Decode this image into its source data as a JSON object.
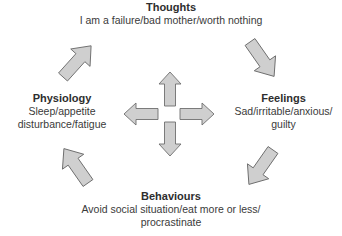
{
  "diagram": {
    "type": "cycle",
    "nodes": [
      {
        "id": "thoughts",
        "title": "Thoughts",
        "desc_lines": [
          "I am a failure/bad mother/worth nothing"
        ]
      },
      {
        "id": "feelings",
        "title": "Feelings",
        "desc_lines": [
          "Sad/irritable/anxious/",
          "guilty"
        ]
      },
      {
        "id": "behaviours",
        "title": "Behaviours",
        "desc_lines": [
          "Avoid social situation/eat more or less/",
          "procrastinate"
        ]
      },
      {
        "id": "physiology",
        "title": "Physiology",
        "desc_lines": [
          "Sleep/appetite",
          "disturbance/fatigue"
        ]
      }
    ],
    "cycle_edges": [
      {
        "from": "thoughts",
        "to": "feelings"
      },
      {
        "from": "feelings",
        "to": "behaviours"
      },
      {
        "from": "behaviours",
        "to": "physiology"
      },
      {
        "from": "physiology",
        "to": "thoughts"
      }
    ],
    "center_cross": [
      "up",
      "right",
      "down",
      "left"
    ],
    "colors": {
      "arrow_fill": "#cfcfcf",
      "arrow_stroke": "#6e6e6e",
      "text": "#333333"
    }
  }
}
